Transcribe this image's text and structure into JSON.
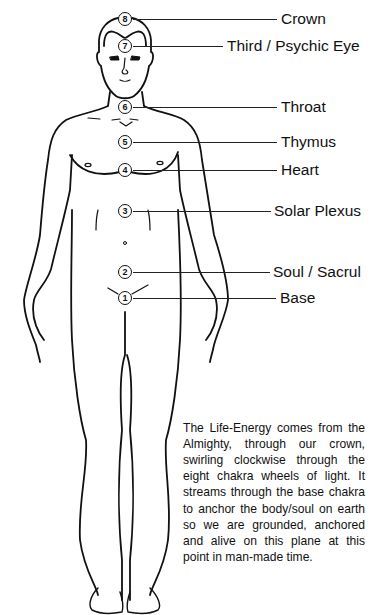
{
  "diagram": {
    "type": "chakra-body-diagram",
    "figure": "front-view male human outline",
    "chakras": [
      {
        "number": "8",
        "label": "Crown",
        "marker_y": 19,
        "label_x": 281
      },
      {
        "number": "7",
        "label": "Third / Psychic Eye",
        "marker_y": 46,
        "label_x": 227
      },
      {
        "number": "6",
        "label": "Throat",
        "marker_y": 107,
        "label_x": 281
      },
      {
        "number": "5",
        "label": "Thymus",
        "marker_y": 142,
        "label_x": 281
      },
      {
        "number": "4",
        "label": "Heart",
        "marker_y": 170,
        "label_x": 281
      },
      {
        "number": "3",
        "label": "Solar Plexus",
        "marker_y": 211,
        "label_x": 274
      },
      {
        "number": "2",
        "label": "Soul / Sacrul",
        "marker_y": 272,
        "label_x": 273
      },
      {
        "number": "1",
        "label": "Base",
        "marker_y": 298,
        "label_x": 280
      }
    ],
    "description": "The Life-Energy comes from the Almighty, through our crown, swirling clockwise through the eight chakra wheels of light. It streams through the base chakra to anchor the body/soul on earth so we are grounded, anchored and alive on this plane at this point in man-made time.",
    "colors": {
      "ink": "#111111",
      "background": "#ffffff"
    }
  }
}
